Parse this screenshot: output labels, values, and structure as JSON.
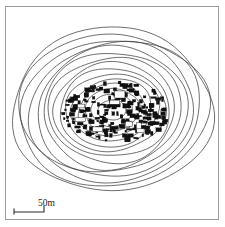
{
  "figure": {
    "kind": "archaeological-site-plan",
    "background_color": "#ffffff",
    "frame": {
      "border_color": "#9b9b9b",
      "x": 5,
      "y": 6,
      "width": 214,
      "height": 214
    }
  },
  "scale_bar": {
    "label": "50m",
    "units": "m",
    "length_value": 50,
    "line_color": "#2b2b2b",
    "bar_pixel_length": 30,
    "x": 14,
    "y": 212
  },
  "chart_data": {
    "type": "contour-map",
    "title": "",
    "xlabel": "",
    "ylabel": "",
    "grid": false,
    "legend": null,
    "annotations": [
      "50m"
    ],
    "topography": {
      "description": "Concentric oval contour rings of a low settlement mound (tell), elongated east-west",
      "ring_count": 15,
      "center_x": 112,
      "center_y": 110,
      "outer_rx": 100,
      "outer_ry": 82,
      "inner_rx": 14,
      "inner_ry": 10,
      "stroke_color": "#3a3a3a",
      "rings_rx": [
        100,
        94,
        88,
        82,
        76,
        70,
        64,
        58,
        52,
        46,
        40,
        34,
        28,
        21,
        14
      ],
      "rings_ry": [
        82,
        77,
        72,
        67,
        62,
        57,
        52,
        47,
        42,
        37,
        31,
        26,
        21,
        16,
        10
      ],
      "rings_rotation_deg": -6
    },
    "settlement": {
      "description": "Dense cluster of small rectangular mudbrick building footprints occupying the summit of the mound",
      "fill_color": "#121212",
      "extent_x": [
        62,
        172
      ],
      "extent_y": [
        82,
        142
      ],
      "building_count": 236,
      "courtyard_count": 9
    }
  }
}
